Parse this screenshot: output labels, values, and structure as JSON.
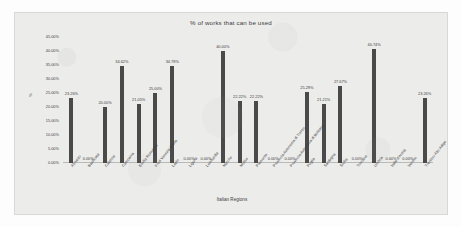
{
  "chart_data": {
    "type": "bar",
    "title": "% of  works that can be used",
    "xlabel": "Italian Regions",
    "ylabel": "%",
    "ylim": [
      0,
      45
    ],
    "grid": false,
    "legend": "none",
    "y_ticks": [
      "0.00%",
      "5.00%",
      "10.00%",
      "15.00%",
      "20.00%",
      "25.00%",
      "30.00%",
      "35.00%",
      "40.00%",
      "45.00%"
    ],
    "y_tick_values": [
      0,
      5,
      10,
      15,
      20,
      25,
      30,
      35,
      40,
      45
    ],
    "categories": [
      "Abruzzo",
      "Basilicata",
      "Calabria",
      "Campania",
      "Emilia-Romagna",
      "Friuli Venezia Giulia",
      "Lazio",
      "Liguria",
      "Lombardia",
      "Marche",
      "Molise",
      "Piemonte",
      "Provincia Autonoma di Trento",
      "Provincia Autonoma di Bolzano",
      "Puglia",
      "Sardegna",
      "Sicilia",
      "Toscana",
      "Umbria",
      "Valle d'Aosta",
      "Veneto",
      "Trentino-Alto Adige"
    ],
    "values": [
      23.26,
      0.0,
      20.0,
      34.62,
      21.05,
      25.0,
      34.78,
      0.0,
      0.0,
      40.0,
      22.22,
      22.22,
      0.0,
      0.0,
      25.29,
      21.21,
      27.67,
      0.0,
      40.74,
      0.0,
      0.0,
      23.26
    ],
    "data_labels": [
      "23.26%",
      "0.00%",
      "20.00%",
      "34.62%",
      "21.05%",
      "25.00%",
      "34.78%",
      "0.00%",
      "0.00%",
      "40.00%",
      "22.22%",
      "22.22%",
      "0.00%",
      "0.00%",
      "25.29%",
      "21.21%",
      "27.67%",
      "0.00%",
      "40.74%",
      "0.00%",
      "0.00%",
      "23.26%"
    ],
    "bar_color": "#4a4a4a",
    "plot_background": "#ececeb"
  }
}
